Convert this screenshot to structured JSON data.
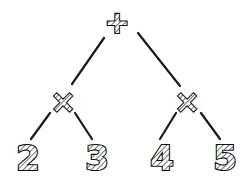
{
  "diagram": {
    "type": "expression-tree",
    "style": "hand-drawn sketch, hatched glyphs",
    "colors": {
      "ink": "#111111",
      "background": "#ffffff"
    },
    "nodes": [
      {
        "id": "root",
        "label": "+",
        "x": 117,
        "y": 22,
        "kind": "operator"
      },
      {
        "id": "mul_left",
        "label": "×",
        "x": 63,
        "y": 101,
        "kind": "operator"
      },
      {
        "id": "mul_right",
        "label": "×",
        "x": 187,
        "y": 101,
        "kind": "operator"
      },
      {
        "id": "leaf_2",
        "label": "2",
        "x": 28,
        "y": 158,
        "kind": "operand"
      },
      {
        "id": "leaf_3",
        "label": "3",
        "x": 97,
        "y": 158,
        "kind": "operand"
      },
      {
        "id": "leaf_4",
        "label": "4",
        "x": 162,
        "y": 158,
        "kind": "operand"
      },
      {
        "id": "leaf_5",
        "label": "5",
        "x": 225,
        "y": 158,
        "kind": "operand"
      }
    ],
    "edges": [
      {
        "from": "root",
        "to": "mul_left",
        "x1": 104,
        "y1": 38,
        "x2": 72,
        "y2": 84
      },
      {
        "from": "root",
        "to": "mul_right",
        "x1": 138,
        "y1": 33,
        "x2": 180,
        "y2": 86
      },
      {
        "from": "mul_left",
        "to": "leaf_2",
        "x1": 50,
        "y1": 113,
        "x2": 31,
        "y2": 139
      },
      {
        "from": "mul_left",
        "to": "leaf_3",
        "x1": 75,
        "y1": 113,
        "x2": 92,
        "y2": 139
      },
      {
        "from": "mul_right",
        "to": "leaf_4",
        "x1": 176,
        "y1": 113,
        "x2": 160,
        "y2": 139
      },
      {
        "from": "mul_right",
        "to": "leaf_5",
        "x1": 201,
        "y1": 113,
        "x2": 220,
        "y2": 139
      }
    ],
    "expression": "(2 × 3) + (4 × 5)"
  }
}
